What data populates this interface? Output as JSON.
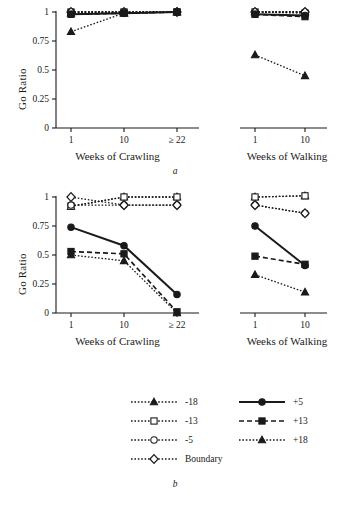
{
  "figure": {
    "caption_a": "a",
    "caption_b": "b",
    "ylabel": "Go Ratio",
    "xlabel_crawling": "Weeks of Crawling",
    "xlabel_walking": "Weeks of Walking",
    "ytick_labels": [
      "1",
      "0.75",
      "0.5",
      "0.25",
      "0"
    ],
    "ytick_values": [
      1,
      0.75,
      0.5,
      0.25,
      0
    ],
    "xtick_labels_crawling": [
      "1",
      "10",
      "≥ 22"
    ],
    "xtick_labels_walking": [
      "1",
      "10"
    ],
    "axis_color": "#1a1a1a"
  },
  "legend": {
    "entries": [
      {
        "label": "-18",
        "marker": "triangle-filled",
        "line": "dotted",
        "filled": true,
        "color": "#1a1a1a",
        "col": 0,
        "row": 0
      },
      {
        "label": "-13",
        "marker": "square-open",
        "line": "dotted",
        "filled": false,
        "color": "#1a1a1a",
        "col": 0,
        "row": 1
      },
      {
        "label": "-5",
        "marker": "circle-open",
        "line": "dotted",
        "filled": false,
        "color": "#1a1a1a",
        "col": 0,
        "row": 2
      },
      {
        "label": "Boundary",
        "marker": "diamond-open",
        "line": "dotted",
        "filled": false,
        "color": "#1a1a1a",
        "col": 0,
        "row": 3
      },
      {
        "label": "+5",
        "marker": "circle-filled",
        "line": "solid",
        "filled": true,
        "color": "#1a1a1a",
        "col": 1,
        "row": 0
      },
      {
        "label": "+13",
        "marker": "square-filled",
        "line": "dashed",
        "filled": true,
        "color": "#1a1a1a",
        "col": 1,
        "row": 1
      },
      {
        "label": "+18",
        "marker": "triangle-filled",
        "line": "dotted",
        "filled": true,
        "color": "#1a1a1a",
        "col": 1,
        "row": 2
      }
    ]
  },
  "chart_data": [
    {
      "id": "panel-a-crawling",
      "type": "line",
      "title": "a",
      "xlabel": "Weeks of Crawling",
      "ylabel": "Go Ratio",
      "categories": [
        "1",
        "10",
        "≥ 22"
      ],
      "ylim": [
        0,
        1
      ],
      "yticks": [
        0,
        0.25,
        0.5,
        0.75,
        1
      ],
      "grid": false,
      "legend_position": "bottom",
      "series": [
        {
          "name": "-18",
          "marker": "triangle-filled",
          "line": "dotted",
          "values": [
            0.99,
            0.99,
            1.0
          ]
        },
        {
          "name": "-13",
          "marker": "square-open",
          "line": "dotted",
          "values": [
            1.0,
            1.0,
            1.0
          ]
        },
        {
          "name": "-5",
          "marker": "circle-open",
          "line": "dotted",
          "values": [
            1.0,
            1.0,
            1.0
          ]
        },
        {
          "name": "Boundary",
          "marker": "diamond-open",
          "line": "dotted",
          "values": [
            1.0,
            1.0,
            1.0
          ]
        },
        {
          "name": "+5",
          "marker": "circle-filled",
          "line": "solid",
          "values": [
            0.98,
            0.99,
            1.0
          ]
        },
        {
          "name": "+13",
          "marker": "square-filled",
          "line": "dashed",
          "values": [
            0.98,
            0.99,
            1.0
          ]
        },
        {
          "name": "+18",
          "marker": "triangle-filled",
          "line": "dotted",
          "values": [
            0.83,
            0.99,
            1.0
          ]
        }
      ]
    },
    {
      "id": "panel-a-walking",
      "type": "line",
      "title": "a",
      "xlabel": "Weeks of Walking",
      "ylabel": "Go Ratio",
      "categories": [
        "1",
        "10"
      ],
      "ylim": [
        0,
        1
      ],
      "yticks": [
        0,
        0.25,
        0.5,
        0.75,
        1
      ],
      "grid": false,
      "series": [
        {
          "name": "-18",
          "marker": "triangle-filled",
          "line": "dotted",
          "values": [
            1.0,
            1.0
          ]
        },
        {
          "name": "-13",
          "marker": "square-open",
          "line": "dotted",
          "values": [
            1.0,
            0.99
          ]
        },
        {
          "name": "-5",
          "marker": "circle-open",
          "line": "dotted",
          "values": [
            1.0,
            1.0
          ]
        },
        {
          "name": "Boundary",
          "marker": "diamond-open",
          "line": "dotted",
          "values": [
            1.0,
            1.0
          ]
        },
        {
          "name": "+5",
          "marker": "circle-filled",
          "line": "solid",
          "values": [
            0.98,
            0.97
          ]
        },
        {
          "name": "+13",
          "marker": "square-filled",
          "line": "dashed",
          "values": [
            0.98,
            0.96
          ]
        },
        {
          "name": "+18",
          "marker": "triangle-filled",
          "line": "dotted",
          "values": [
            0.63,
            0.45
          ]
        }
      ]
    },
    {
      "id": "panel-b-crawling",
      "type": "line",
      "title": "b",
      "xlabel": "Weeks of Crawling",
      "ylabel": "Go Ratio",
      "categories": [
        "1",
        "10",
        "≥ 22"
      ],
      "ylim": [
        0,
        1
      ],
      "yticks": [
        0,
        0.25,
        0.5,
        0.75,
        1
      ],
      "grid": false,
      "legend_position": "bottom",
      "series": [
        {
          "name": "-18",
          "marker": "triangle-filled",
          "line": "dotted",
          "values": [
            0.92,
            1.0,
            1.0
          ]
        },
        {
          "name": "-13",
          "marker": "square-open",
          "line": "dotted",
          "values": [
            0.92,
            1.0,
            1.0
          ]
        },
        {
          "name": "-5",
          "marker": "circle-open",
          "line": "dotted",
          "values": [
            0.93,
            0.93,
            0.93
          ]
        },
        {
          "name": "Boundary",
          "marker": "diamond-open",
          "line": "dotted",
          "values": [
            1.0,
            0.93,
            0.93
          ]
        },
        {
          "name": "+5",
          "marker": "circle-filled",
          "line": "solid",
          "values": [
            0.74,
            0.58,
            0.16
          ]
        },
        {
          "name": "+13",
          "marker": "square-filled",
          "line": "dashed",
          "values": [
            0.53,
            0.51,
            0.01
          ]
        },
        {
          "name": "+18",
          "marker": "triangle-filled",
          "line": "dotted",
          "values": [
            0.5,
            0.45,
            0.0
          ]
        }
      ]
    },
    {
      "id": "panel-b-walking",
      "type": "line",
      "title": "b",
      "xlabel": "Weeks of Walking",
      "ylabel": "Go Ratio",
      "categories": [
        "1",
        "10"
      ],
      "ylim": [
        0,
        1
      ],
      "yticks": [
        0,
        0.25,
        0.5,
        0.75,
        1
      ],
      "grid": false,
      "series": [
        {
          "name": "-18",
          "marker": "triangle-filled",
          "line": "dotted",
          "values": [
            1.0,
            1.01
          ]
        },
        {
          "name": "-13",
          "marker": "square-open",
          "line": "dotted",
          "values": [
            1.0,
            1.01
          ]
        },
        {
          "name": "-5",
          "marker": "circle-open",
          "line": "dotted",
          "values": [
            0.93,
            0.86
          ]
        },
        {
          "name": "Boundary",
          "marker": "diamond-open",
          "line": "dotted",
          "values": [
            0.93,
            0.86
          ]
        },
        {
          "name": "+5",
          "marker": "circle-filled",
          "line": "solid",
          "values": [
            0.75,
            0.41
          ]
        },
        {
          "name": "+13",
          "marker": "square-filled",
          "line": "dashed",
          "values": [
            0.49,
            0.42
          ]
        },
        {
          "name": "+18",
          "marker": "triangle-filled",
          "line": "dotted",
          "values": [
            0.33,
            0.18
          ]
        }
      ]
    }
  ]
}
